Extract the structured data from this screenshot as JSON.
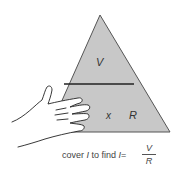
{
  "diagram": {
    "triangle": {
      "fill": "#c8c8c8",
      "stroke": "#444444",
      "top_label": "V",
      "bottom_left_label": "I",
      "operator": "x",
      "bottom_right_label": "R"
    },
    "caption": {
      "prefix": "cover ",
      "covered_var": "I",
      "middle": " to find ",
      "result_var": "I",
      "equals": "=",
      "numerator": "V",
      "denominator": "R"
    },
    "illustration": "hand-covering-I"
  }
}
